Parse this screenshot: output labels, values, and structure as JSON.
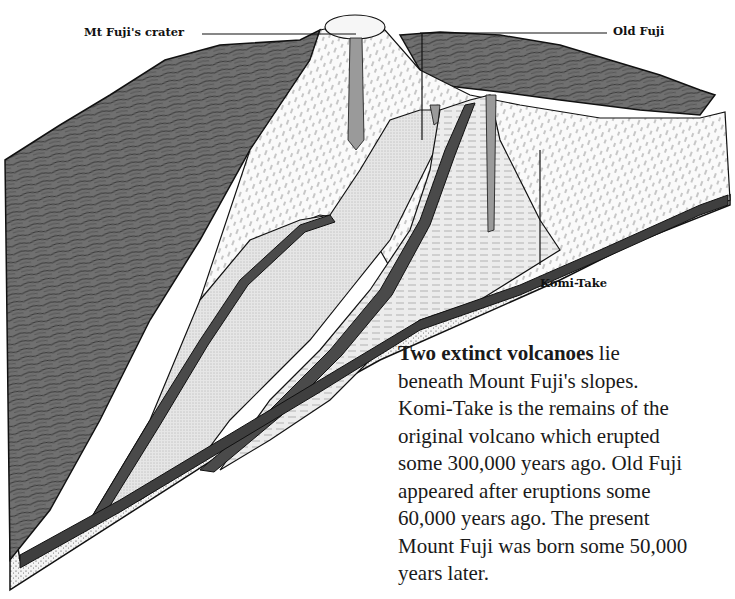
{
  "diagram": {
    "labels": {
      "crater": "Mt Fuji's crater",
      "old_fuji": "Old Fuji",
      "komi_take": "Komi-Take"
    },
    "colors": {
      "ink": "#111111",
      "mountain_surface": "#6b6b6b",
      "old_fuji_layer": "#e8e8e8",
      "komi_take_layer": "#d8d8d8",
      "base_rock": "#f2f2f2",
      "background": "#ffffff"
    }
  },
  "caption": {
    "lead_bold": "Two extinct volcanoes",
    "lines": [
      " lie",
      "beneath Mount Fuji's slopes.",
      "Komi-Take is the remains of the",
      "original volcano which erupted",
      "some 300,000 years ago. Old Fuji",
      "appeared after eruptions some",
      "60,000 years ago. The present",
      "Mount Fuji was born some 50,000",
      "years later."
    ]
  }
}
